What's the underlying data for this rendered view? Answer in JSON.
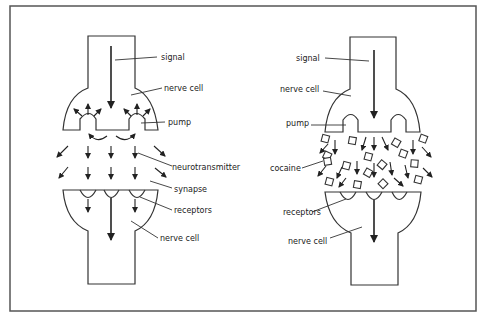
{
  "figure": {
    "frame_color": "#555555",
    "line_color": "#333333",
    "background": "#ffffff"
  },
  "left_panel": {
    "name": "normal-synapse",
    "labels": {
      "signal": "signal",
      "nerve_cell_top": "nerve cell",
      "pump": "pump",
      "neurotransmitter": "neurotransmitter",
      "synapse": "synapse",
      "receptors": "receptors",
      "nerve_cell_bottom": "nerve cell"
    }
  },
  "right_panel": {
    "name": "cocaine-synapse",
    "labels": {
      "signal": "signal",
      "nerve_cell_top": "nerve cell",
      "pump": "pump",
      "cocaine": "cocaine",
      "receptors": "receptors",
      "nerve_cell_bottom": "nerve cell"
    }
  }
}
